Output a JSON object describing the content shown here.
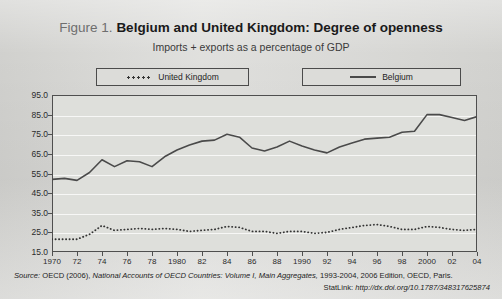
{
  "figure": {
    "label": "Figure 1.",
    "title": "Belgium and United Kingdom: Degree of openness",
    "subtitle": "Imports + exports as a percentage of GDP"
  },
  "legend": {
    "uk_label": "United Kingdom",
    "belgium_label": "Belgium"
  },
  "footer": {
    "source_prefix": "Source:",
    "source_text_1": "OECD (2006),",
    "source_italic": "National Accounts of OECD Countries: Volume I, Main Aggregates,",
    "source_text_2": "1993-2004, 2006 Edition, OECD, Paris.",
    "statlink_label": "StatLink:",
    "statlink_url": "http://dx.doi.org/10.1787/348317625874"
  },
  "colors": {
    "page_background": "#d9d9d6",
    "plot_background": "#dedfdb",
    "axis": "#4f4f4f",
    "belgium_line": "#4a4a4a",
    "uk_line": "#333333",
    "gridline": "#ffffff"
  },
  "chart_data": {
    "type": "line",
    "title": "Belgium and United Kingdom: Degree of openness",
    "subtitle": "Imports + exports as a percentage of GDP",
    "xlabel": "",
    "ylabel": "",
    "xlim": [
      1970,
      2004
    ],
    "ylim": [
      15.0,
      95.0
    ],
    "yticks": [
      15.0,
      25.0,
      35.0,
      45.0,
      55.0,
      65.0,
      75.0,
      85.0,
      95.0
    ],
    "ytick_labels": [
      "15.0",
      "25.0",
      "35.0",
      "45.0",
      "55.0",
      "65.0",
      "75.0",
      "85.0",
      "95.0"
    ],
    "x": [
      1970,
      1971,
      1972,
      1973,
      1974,
      1975,
      1976,
      1977,
      1978,
      1979,
      1980,
      1981,
      1982,
      1983,
      1984,
      1985,
      1986,
      1987,
      1988,
      1989,
      1990,
      1991,
      1992,
      1993,
      1994,
      1995,
      1996,
      1997,
      1998,
      1999,
      2000,
      2001,
      2002,
      2003,
      2004
    ],
    "xticks": [
      1970,
      1972,
      1974,
      1976,
      1978,
      1980,
      1982,
      1984,
      1986,
      1988,
      1990,
      1992,
      1994,
      1996,
      1998,
      2000,
      2002,
      2004
    ],
    "xtick_labels": [
      "1970",
      "72",
      "74",
      "76",
      "78",
      "1980",
      "82",
      "84",
      "86",
      "88",
      "1990",
      "92",
      "94",
      "96",
      "98",
      "2000",
      "02",
      "04"
    ],
    "grid": true,
    "legend_position": "above-plot",
    "series": [
      {
        "name": "Belgium",
        "style": "solid",
        "values": [
          52.0,
          52.5,
          51.5,
          55.5,
          62.0,
          58.5,
          61.5,
          61.0,
          58.5,
          63.5,
          67.0,
          69.5,
          71.5,
          72.0,
          75.0,
          73.5,
          68.0,
          66.5,
          68.5,
          71.5,
          69.0,
          67.0,
          65.5,
          68.5,
          70.5,
          72.5,
          73.0,
          73.5,
          76.0,
          76.5,
          85.0,
          85.0,
          83.5,
          82.0,
          84.0
        ]
      },
      {
        "name": "United Kingdom",
        "style": "dotted",
        "values": [
          21.5,
          21.5,
          21.5,
          24.0,
          28.5,
          26.0,
          26.5,
          27.0,
          26.5,
          27.0,
          26.5,
          25.5,
          26.0,
          26.5,
          28.0,
          27.5,
          25.5,
          25.5,
          24.5,
          25.5,
          25.5,
          24.5,
          25.0,
          26.5,
          27.5,
          28.5,
          29.0,
          28.0,
          26.5,
          26.5,
          28.0,
          27.5,
          26.5,
          26.0,
          26.5
        ]
      }
    ]
  }
}
